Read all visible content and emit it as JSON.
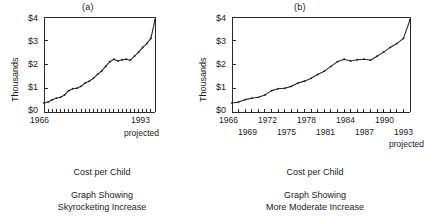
{
  "figure": {
    "panels": [
      {
        "id": "a",
        "label": "(a)",
        "ylabel": "Thousands",
        "yticks": [
          "$0",
          "$1",
          "$2",
          "$3",
          "$4"
        ],
        "xticks_row1": [
          "1966"
        ],
        "xticks_row2": [
          "1993"
        ],
        "projected_note": "projected",
        "caption_line1": "Cost per Child",
        "caption_line2": "Graph Showing",
        "caption_line3": "Skyrocketing Increase"
      },
      {
        "id": "b",
        "label": "(b)",
        "ylabel": "Thousands",
        "yticks": [
          "$0",
          "$1",
          "$2",
          "$3",
          "$4"
        ],
        "xticks_row1": [
          "1966",
          "1972",
          "1978",
          "1984",
          "1990"
        ],
        "xticks_row2": [
          "1969",
          "1975",
          "1981",
          "1987",
          "1993"
        ],
        "projected_note": "projected",
        "caption_line1": "Cost per Child",
        "caption_line2": "Graph Showing",
        "caption_line3": "More Moderate Increase"
      }
    ]
  },
  "chart_data": [
    {
      "type": "line",
      "title": "(a)",
      "subtitle": "Cost per Child — Graph Showing Skyrocketing Increase",
      "xlabel": "",
      "ylabel": "Thousands",
      "ylim": [
        0,
        4
      ],
      "yticks": [
        0,
        1,
        2,
        3,
        4
      ],
      "ytick_labels": [
        "$0",
        "$1",
        "$2",
        "$3",
        "$4"
      ],
      "xlim": [
        1966,
        1993
      ],
      "xtick_labels_shown": [
        "1966",
        "1993"
      ],
      "grid": false,
      "legend": false,
      "note": "projected",
      "aspect_note": "narrow x-axis, tall y-axis — exaggerates the slope",
      "x": [
        1966,
        1967,
        1968,
        1969,
        1970,
        1971,
        1972,
        1973,
        1974,
        1975,
        1976,
        1977,
        1978,
        1979,
        1980,
        1981,
        1982,
        1983,
        1984,
        1985,
        1986,
        1987,
        1988,
        1989,
        1990,
        1991,
        1992,
        1993
      ],
      "y": [
        0.38,
        0.42,
        0.52,
        0.58,
        0.62,
        0.72,
        0.9,
        0.98,
        1.0,
        1.08,
        1.22,
        1.3,
        1.42,
        1.58,
        1.72,
        1.92,
        2.12,
        2.22,
        2.15,
        2.2,
        2.22,
        2.18,
        2.35,
        2.52,
        2.72,
        2.88,
        3.1,
        3.88
      ]
    },
    {
      "type": "line",
      "title": "(b)",
      "subtitle": "Cost per Child — Graph Showing More Moderate Increase",
      "xlabel": "",
      "ylabel": "Thousands",
      "ylim": [
        0,
        4
      ],
      "yticks": [
        0,
        1,
        2,
        3,
        4
      ],
      "ytick_labels": [
        "$0",
        "$1",
        "$2",
        "$3",
        "$4"
      ],
      "xlim": [
        1966,
        1993
      ],
      "xtick_labels_shown": [
        "1966",
        "1969",
        "1972",
        "1975",
        "1978",
        "1981",
        "1984",
        "1987",
        "1990",
        "1993"
      ],
      "grid": false,
      "legend": false,
      "note": "projected",
      "aspect_note": "wide x-axis — flattens the same data",
      "x": [
        1966,
        1967,
        1968,
        1969,
        1970,
        1971,
        1972,
        1973,
        1974,
        1975,
        1976,
        1977,
        1978,
        1979,
        1980,
        1981,
        1982,
        1983,
        1984,
        1985,
        1986,
        1987,
        1988,
        1989,
        1990,
        1991,
        1992,
        1993
      ],
      "y": [
        0.38,
        0.42,
        0.52,
        0.58,
        0.62,
        0.72,
        0.9,
        0.98,
        1.0,
        1.08,
        1.22,
        1.3,
        1.42,
        1.58,
        1.72,
        1.92,
        2.12,
        2.22,
        2.15,
        2.2,
        2.22,
        2.18,
        2.35,
        2.52,
        2.72,
        2.88,
        3.1,
        3.88
      ]
    }
  ]
}
